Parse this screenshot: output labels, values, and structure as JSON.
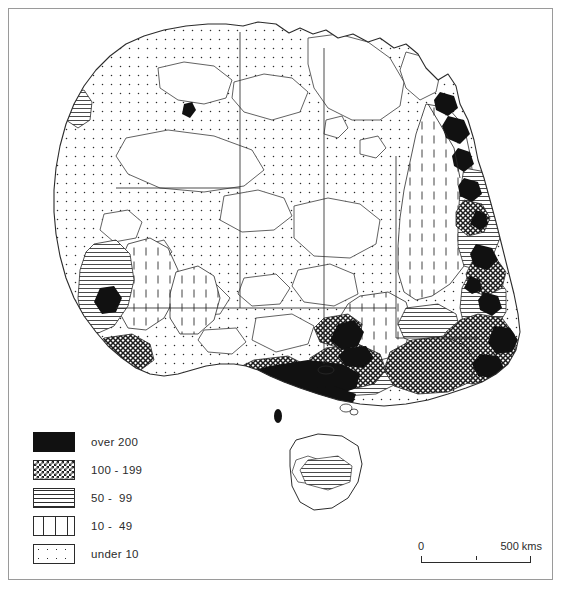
{
  "figure": {
    "caption": ""
  },
  "legend": {
    "name": "density-legend",
    "units": "persons per square kilometre",
    "items": [
      {
        "pattern": "solid-black",
        "label": "over 200"
      },
      {
        "pattern": "cross-hatch",
        "label": "100 - 199"
      },
      {
        "pattern": "horizontal-lines",
        "label": "50 -  99"
      },
      {
        "pattern": "vertical-dashes",
        "label": "10 -  49"
      },
      {
        "pattern": "sparse-dots",
        "label": "under 10"
      }
    ]
  },
  "scalebar": {
    "name": "distance-scale",
    "zero_label": "0",
    "max_label": "500 kms",
    "max_value": 500,
    "units": "kms"
  },
  "map": {
    "name": "australia-choropleth",
    "region": "Australia",
    "projection": "simple",
    "colors": {
      "outline": "#2b2b2b",
      "frame": "#9a9a9a",
      "background": "#ffffff",
      "over200": "#111111"
    }
  }
}
